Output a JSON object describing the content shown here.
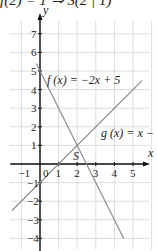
{
  "header_text": "f(2) = 1  ⇒  S(2 | 1)",
  "colors": {
    "grid": "#dcdcdc",
    "axis": "#111111",
    "line": "#8c8c8c"
  },
  "chart_data": {
    "type": "line",
    "title": "",
    "xlabel": "x",
    "ylabel": "y",
    "xlim": [
      -1.5,
      5.8
    ],
    "ylim": [
      -4.5,
      7.8
    ],
    "grid": true,
    "x_ticks": [
      "-1",
      "0",
      "1",
      "2",
      "3",
      "4",
      "5"
    ],
    "y_ticks": [
      "7",
      "6",
      "5",
      "4",
      "3",
      "2",
      "1",
      "-1",
      "-2",
      "-3",
      "-4"
    ],
    "series": [
      {
        "name": "f(x) = −2x + 5",
        "expression": "-2x+5",
        "x": [
          -0.2,
          4.5
        ],
        "y": [
          5.4,
          -4
        ]
      },
      {
        "name": "g(x) = x − 1",
        "expression": "x-1",
        "x": [
          -1.5,
          5.5
        ],
        "y": [
          -2.5,
          4.5
        ]
      }
    ],
    "annotations": [
      {
        "text": "S",
        "x": 2,
        "y": 1
      }
    ]
  },
  "labels": {
    "f": "f (x) = −2x + 5",
    "g": "g (x) = x − 1",
    "s": "S",
    "x_axis": "x",
    "y_axis": "y"
  }
}
